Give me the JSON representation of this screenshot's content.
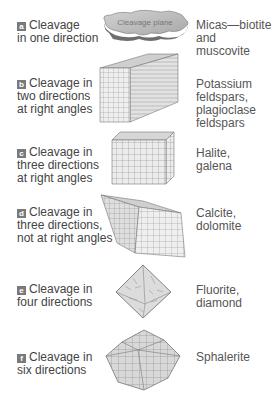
{
  "title_fragment": "",
  "rows": [
    {
      "letter": "a",
      "description_lines": [
        "Cleavage",
        "in one direction"
      ],
      "shape": "sheet",
      "shape_label": "Cleavage plane",
      "minerals_lines": [
        "Micas—biotite",
        "and muscovite"
      ]
    },
    {
      "letter": "b",
      "description_lines": [
        "Cleavage in",
        "two directions",
        "at right angles"
      ],
      "shape": "prism",
      "minerals_lines": [
        "Potassium",
        "feldspars,",
        "plagioclase",
        "feldspars"
      ]
    },
    {
      "letter": "c",
      "description_lines": [
        "Cleavage in",
        "three directions",
        "at right angles"
      ],
      "shape": "cube",
      "minerals_lines": [
        "Halite,",
        "galena"
      ]
    },
    {
      "letter": "d",
      "description_lines": [
        "Cleavage in",
        "three directions,",
        "not at right angles"
      ],
      "shape": "rhombohedron",
      "minerals_lines": [
        "Calcite,",
        "dolomite"
      ]
    },
    {
      "letter": "e",
      "description_lines": [
        "Cleavage in",
        "four directions"
      ],
      "shape": "octahedron",
      "minerals_lines": [
        "Fluorite,",
        "diamond"
      ]
    },
    {
      "letter": "f",
      "description_lines": [
        "Cleavage in",
        "six directions"
      ],
      "shape": "dodecahedron",
      "minerals_lines": [
        "Sphalerite"
      ]
    }
  ],
  "colors": {
    "badge": "#7a7a7a",
    "text": "#444444",
    "shape_fill": "#d9d9d9",
    "shape_line": "#555555"
  }
}
